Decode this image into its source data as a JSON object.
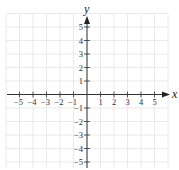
{
  "figure": {
    "type": "coordinate-plane",
    "x_axis_label": "x",
    "y_axis_label": "y",
    "x_ticks": [
      "-5",
      "-4",
      "-3",
      "-2",
      "-1",
      "1",
      "2",
      "3",
      "4",
      "5"
    ],
    "y_ticks": [
      "5",
      "4",
      "3",
      "2",
      "1",
      "-1",
      "-2",
      "-3",
      "-4",
      "-5"
    ],
    "grid_range": {
      "x": [
        -6,
        6
      ],
      "y": [
        -5.5,
        6
      ]
    },
    "colors": {
      "grid": "#e4e4e4",
      "axis": "#333333",
      "background": "#ffffff"
    }
  }
}
